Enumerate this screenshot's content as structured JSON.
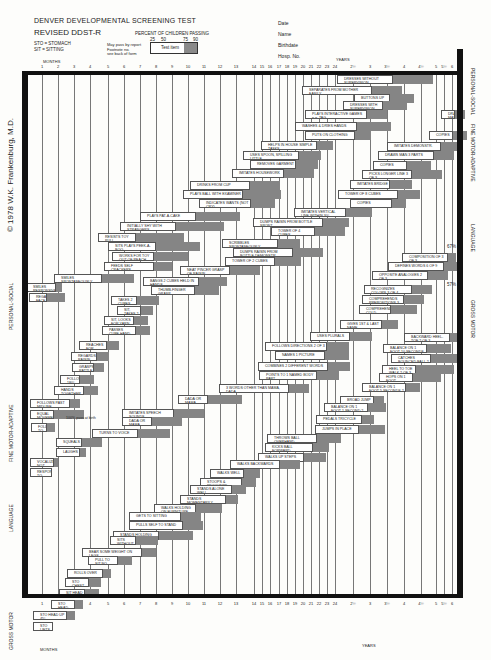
{
  "header": {
    "title": "DENVER DEVELOPMENTAL SCREENING TEST",
    "subtitle": "REVISED DDST-R",
    "abbrev_1": "STO = STOMACH",
    "abbrev_2": "SIT = SITTING",
    "percent_title": "PERCENT OF CHILDREN PASSING",
    "percent_ticks": [
      "25",
      "50",
      "75",
      "90"
    ],
    "legend_note_1": "May pass by report",
    "legend_note_2": "Footnote no.",
    "legend_note_3": "see back of form",
    "legend_item": "Test item"
  },
  "patient_fields": [
    "Date",
    "Name",
    "Birthdate",
    "Hosp. No."
  ],
  "axis": {
    "months_label": "MONTHS",
    "years_label": "YEARS",
    "ticks": [
      {
        "label": "1",
        "x": 42
      },
      {
        "label": "2",
        "x": 58
      },
      {
        "label": "3",
        "x": 74
      },
      {
        "label": "4",
        "x": 90
      },
      {
        "label": "5",
        "x": 108
      },
      {
        "label": "6",
        "x": 124
      },
      {
        "label": "7",
        "x": 140
      },
      {
        "label": "8",
        "x": 156
      },
      {
        "label": "9",
        "x": 172
      },
      {
        "label": "10",
        "x": 188
      },
      {
        "label": "11",
        "x": 204
      },
      {
        "label": "12",
        "x": 220
      },
      {
        "label": "13",
        "x": 236
      },
      {
        "label": "14",
        "x": 254
      },
      {
        "label": "15",
        "x": 262
      },
      {
        "label": "16",
        "x": 270
      },
      {
        "label": "17",
        "x": 279
      },
      {
        "label": "18",
        "x": 287
      },
      {
        "label": "19",
        "x": 295
      },
      {
        "label": "20",
        "x": 303
      },
      {
        "label": "21",
        "x": 311
      },
      {
        "label": "22",
        "x": 319
      },
      {
        "label": "23",
        "x": 327
      },
      {
        "label": "24",
        "x": 335
      },
      {
        "label": "2½",
        "x": 353
      },
      {
        "label": "3",
        "x": 370
      },
      {
        "label": "3½",
        "x": 387
      },
      {
        "label": "4",
        "x": 404
      },
      {
        "label": "4½",
        "x": 421
      },
      {
        "label": "5",
        "x": 436
      },
      {
        "label": "5½",
        "x": 444
      },
      {
        "label": "6",
        "x": 452
      }
    ]
  },
  "sections_left": [
    "GROSS MOTOR",
    "LANGUAGE",
    "FINE MOTOR-ADAPTIVE",
    "PERSONAL-SOCIAL"
  ],
  "sections_right": [
    "PERSONAL-SOCIAL",
    "FINE MOTOR-ADAPTIVE",
    "LANGUAGE",
    "GROSS MOTOR"
  ],
  "copyright": "© 1978 W.K. Frankenburg, M.D.",
  "notes": {
    "pct_67_top": "67%",
    "pct_67_bottom": "57%",
    "pct_100": "100% pass at birth"
  },
  "items": [
    {
      "label": "DRESSES WITHOUT SUPERVISION",
      "x": 337,
      "y": 77,
      "w": 56,
      "s": 40
    },
    {
      "label": "SEPARATES FROM MOTHER EASILY",
      "x": 302,
      "y": 88,
      "w": 70,
      "s": 30
    },
    {
      "label": "BUTTONS UP",
      "x": 354,
      "y": 96,
      "w": 36,
      "s": 24
    },
    {
      "label": "DRESSES WITH SUPERVISION",
      "x": 343,
      "y": 103,
      "w": 40,
      "s": 24
    },
    {
      "label": "PLAYS INTERACTIVE GAMES e.g. TAG",
      "x": 305,
      "y": 112,
      "w": 62,
      "s": 20
    },
    {
      "label": "WASHES & DRIES HANDS",
      "x": 295,
      "y": 124,
      "w": 62,
      "s": 34
    },
    {
      "label": "PUTS ON CLOTHING",
      "x": 305,
      "y": 133,
      "w": 50,
      "s": 16
    },
    {
      "label": "HELPS IN HOUSE SIMPLE TASKS",
      "x": 261,
      "y": 143,
      "w": 56,
      "s": 16
    },
    {
      "label": "USES SPOON, SPILLING LITTLE",
      "x": 243,
      "y": 153,
      "w": 56,
      "s": 22
    },
    {
      "label": "REMOVES GARMENT",
      "x": 250,
      "y": 162,
      "w": 46,
      "s": 22
    },
    {
      "label": "IMITATES HOUSEWORK",
      "x": 232,
      "y": 171,
      "w": 52,
      "s": 30
    },
    {
      "label": "DRINKS FROM CUP",
      "x": 190,
      "y": 183,
      "w": 60,
      "s": 30
    },
    {
      "label": "PLAYS BALL WITH EXAMINER",
      "x": 183,
      "y": 192,
      "w": 60,
      "s": 38
    },
    {
      "label": "INDICATES WANTS (NOT CRY)",
      "x": 199,
      "y": 201,
      "w": 52,
      "s": 24
    },
    {
      "label": "PLAYS PAT-A-CAKE",
      "x": 140,
      "y": 214,
      "w": 56,
      "s": 44
    },
    {
      "label": "INITIALLY SHY WITH STRANGERS",
      "x": 120,
      "y": 224,
      "w": 56,
      "s": 48
    },
    {
      "label": "RESISTS TOY PULL",
      "x": 98,
      "y": 235,
      "w": 38,
      "s": 48
    },
    {
      "label": "SITS PLAYS PEEK-A-BOO",
      "x": 108,
      "y": 244,
      "w": 48,
      "s": 44
    },
    {
      "label": "WORKS FOR TOY OUT OF REACH",
      "x": 112,
      "y": 254,
      "w": 42,
      "s": 34
    },
    {
      "label": "FEEDS SELF CRACKERS",
      "x": 104,
      "y": 264,
      "w": 50,
      "s": 18
    },
    {
      "label": "SMILES SPONTANEOUSLY",
      "x": 54,
      "y": 276,
      "w": 48,
      "s": 32
    },
    {
      "label": "SMILES RESPONSIVELY",
      "x": 26,
      "y": 285,
      "w": 30,
      "s": 6
    },
    {
      "label": "REGARDS FACE",
      "x": 29,
      "y": 295,
      "w": 18,
      "s": 18
    },
    {
      "label": "DRAWS MAN 6 PARTS",
      "x": 441,
      "y": 112,
      "w": 14,
      "s": 10
    },
    {
      "label": "COPIES",
      "x": 429,
      "y": 133,
      "w": 24,
      "s": 14
    },
    {
      "label": "IMITATES DEMONSTR.",
      "x": 387,
      "y": 144,
      "w": 54,
      "s": 20
    },
    {
      "label": "DRAWS MAN 3 PARTS",
      "x": 378,
      "y": 153,
      "w": 56,
      "s": 20
    },
    {
      "label": "COPIES",
      "x": 373,
      "y": 163,
      "w": 34,
      "s": 24
    },
    {
      "label": "PICKS LONGER LINE 3 OF 3",
      "x": 362,
      "y": 172,
      "w": 50,
      "s": 30
    },
    {
      "label": "IMITATES BRIDGE",
      "x": 350,
      "y": 182,
      "w": 40,
      "s": 22
    },
    {
      "label": "TOWER OF 8 CUBES",
      "x": 338,
      "y": 192,
      "w": 60,
      "s": 22
    },
    {
      "label": "COPIES",
      "x": 350,
      "y": 201,
      "w": 42,
      "s": 14
    },
    {
      "label": "IMITATES VERTICAL LINE WITHIN 30°",
      "x": 294,
      "y": 210,
      "w": 52,
      "s": 26
    },
    {
      "label": "DUMPS RAISIN FROM BOTTLE SPONT.",
      "x": 253,
      "y": 220,
      "w": 70,
      "s": 26
    },
    {
      "label": "TOWER OF 4 CUBES",
      "x": 271,
      "y": 229,
      "w": 44,
      "s": 30
    },
    {
      "label": "SCRIBBLES SPONTANEOUSLY",
      "x": 222,
      "y": 241,
      "w": 56,
      "s": 22
    },
    {
      "label": "DUMPS RAISIN FROM BOTTLE DEMONSTR.",
      "x": 233,
      "y": 250,
      "w": 60,
      "s": 30
    },
    {
      "label": "TOWER OF 2 CUBES",
      "x": 225,
      "y": 259,
      "w": 50,
      "s": 26
    },
    {
      "label": "NEAT PINCER GRASP OF RAISIN",
      "x": 180,
      "y": 268,
      "w": 50,
      "s": 30
    },
    {
      "label": "BANGS 2 CUBES HELD IN HANDS",
      "x": 143,
      "y": 279,
      "w": 56,
      "s": 28
    },
    {
      "label": "THUMB-FINGER GRASP",
      "x": 151,
      "y": 288,
      "w": 44,
      "s": 24
    },
    {
      "label": "TAKES 2 CUBES",
      "x": 111,
      "y": 298,
      "w": 26,
      "s": 22
    },
    {
      "label": "SIT, TAKES 2 CUBES",
      "x": 117,
      "y": 308,
      "w": 24,
      "s": 12
    },
    {
      "label": "SIT, LOOKS FOR YARN",
      "x": 104,
      "y": 318,
      "w": 30,
      "s": 14
    },
    {
      "label": "PASSES CUBE HAND TO HAND",
      "x": 102,
      "y": 328,
      "w": 34,
      "s": 14
    },
    {
      "label": "REACHES FOR OBJECT",
      "x": 79,
      "y": 343,
      "w": 28,
      "s": 12
    },
    {
      "label": "REGARDS RAISIN",
      "x": 71,
      "y": 354,
      "w": 26,
      "s": 12
    },
    {
      "label": "GRASPS RATTLE",
      "x": 72,
      "y": 365,
      "w": 22,
      "s": 10
    },
    {
      "label": "FOLLOWS 180°",
      "x": 60,
      "y": 377,
      "w": 20,
      "s": 14
    },
    {
      "label": "HANDS TOGETHER",
      "x": 54,
      "y": 388,
      "w": 30,
      "s": 14
    },
    {
      "label": "FOLLOWS PAST MIDLINE",
      "x": 30,
      "y": 401,
      "w": 40,
      "s": 10
    },
    {
      "label": "EQUAL MOVEMENTS",
      "x": 30,
      "y": 412,
      "w": 24,
      "s": 30
    },
    {
      "label": "FOLLOWS TO MIDLINE",
      "x": 31,
      "y": 425,
      "w": 16,
      "s": 8
    },
    {
      "label": "COMPOSITION OF 3 OF 3",
      "x": 402,
      "y": 255,
      "w": 46,
      "s": 8
    },
    {
      "label": "DEFINES WORDS 6 OF 9",
      "x": 388,
      "y": 264,
      "w": 56,
      "s": 18
    },
    {
      "label": "OPPOSITE ANALOGIES 2 OF 3",
      "x": 372,
      "y": 273,
      "w": 56,
      "s": 20
    },
    {
      "label": "RECOGNIZES COLORS 3 OF 4",
      "x": 364,
      "y": 287,
      "w": 48,
      "s": 20
    },
    {
      "label": "COMPREHENDS PREPOSITIONS 3 OF 4",
      "x": 362,
      "y": 297,
      "w": 42,
      "s": 20
    },
    {
      "label": "COMPREHENDS COLD, TIRED, HUNGRY 3 OF 3",
      "x": 359,
      "y": 307,
      "w": 32,
      "s": 26
    },
    {
      "label": "GIVES 1ST & LAST NAME",
      "x": 340,
      "y": 322,
      "w": 42,
      "s": 16
    },
    {
      "label": "USES PLURALS",
      "x": 310,
      "y": 334,
      "w": 40,
      "s": 22
    },
    {
      "label": "FOLLOWS DIRECTIONS 2 OF 3",
      "x": 265,
      "y": 344,
      "w": 62,
      "s": 22
    },
    {
      "label": "NAMES 1 PICTURE",
      "x": 275,
      "y": 353,
      "w": 50,
      "s": 24
    },
    {
      "label": "COMBINES 2 DIFFERENT WORDS",
      "x": 258,
      "y": 364,
      "w": 70,
      "s": 22
    },
    {
      "label": "POINTS TO 1 NAMED BODY PART",
      "x": 259,
      "y": 373,
      "w": 58,
      "s": 22
    },
    {
      "label": "3 WORDS OTHER THAN MAMA, DADA",
      "x": 219,
      "y": 386,
      "w": 70,
      "s": 20
    },
    {
      "label": "DADA OR MAMA SPECIFIC",
      "x": 178,
      "y": 397,
      "w": 30,
      "s": 34
    },
    {
      "label": "IMITATES SPEECH SOUNDS",
      "x": 122,
      "y": 411,
      "w": 52,
      "s": 30
    },
    {
      "label": "DADA OR MAMA NONSPECIFIC",
      "x": 122,
      "y": 419,
      "w": 30,
      "s": 30
    },
    {
      "label": "TURNS TO VOICE",
      "x": 92,
      "y": 431,
      "w": 46,
      "s": 32
    },
    {
      "label": "SQUEALS",
      "x": 56,
      "y": 440,
      "w": 26,
      "s": 20
    },
    {
      "label": "LAUGHS",
      "x": 56,
      "y": 450,
      "w": 24,
      "s": 6
    },
    {
      "label": "VOCALIZES NOT CRYING",
      "x": 30,
      "y": 460,
      "w": 24,
      "s": 4
    },
    {
      "label": "RESPONDS TO BELL",
      "x": 30,
      "y": 470,
      "w": 22,
      "s": 0
    },
    {
      "label": "BACKWARD HEEL-TOE 2 OF 3",
      "x": 404,
      "y": 335,
      "w": 46,
      "s": 8
    },
    {
      "label": "BALANCE ON 1 FOOT 10 SECONDS 2 OF 3",
      "x": 383,
      "y": 346,
      "w": 44,
      "s": 24
    },
    {
      "label": "CATCHES BOUNCED BALL 2 OF 3",
      "x": 391,
      "y": 356,
      "w": 40,
      "s": 26
    },
    {
      "label": "HEEL TO TOE WALK 2 OF 3",
      "x": 382,
      "y": 367,
      "w": 34,
      "s": 38
    },
    {
      "label": "HOPS ON 1 FOOT",
      "x": 379,
      "y": 375,
      "w": 34,
      "s": 28
    },
    {
      "label": "BALANCE ON 1 FOOT 5 SECONDS 2 OF 3",
      "x": 362,
      "y": 385,
      "w": 44,
      "s": 14
    },
    {
      "label": "BROAD JUMP",
      "x": 340,
      "y": 398,
      "w": 34,
      "s": 10
    },
    {
      "label": "BALANCE ON 1 FOOT 1 SECOND 2 OF 3",
      "x": 324,
      "y": 405,
      "w": 44,
      "s": 18
    },
    {
      "label": "PEDALS TRICYCLE",
      "x": 316,
      "y": 417,
      "w": 46,
      "s": 12
    },
    {
      "label": "JUMPS IN PLACE",
      "x": 315,
      "y": 427,
      "w": 44,
      "s": 26
    },
    {
      "label": "THROWS BALL OVERHAND",
      "x": 267,
      "y": 436,
      "w": 50,
      "s": 24
    },
    {
      "label": "KICKS BALL FORWARD",
      "x": 265,
      "y": 445,
      "w": 48,
      "s": 16
    },
    {
      "label": "WALKS UP STEPS",
      "x": 258,
      "y": 455,
      "w": 46,
      "s": 22
    },
    {
      "label": "WALKS BACKWARDS",
      "x": 230,
      "y": 462,
      "w": 50,
      "s": 20
    },
    {
      "label": "WALKS WELL",
      "x": 210,
      "y": 471,
      "w": 34,
      "s": 16
    },
    {
      "label": "STOOPS & RECOVERS",
      "x": 200,
      "y": 480,
      "w": 42,
      "s": 14
    },
    {
      "label": "STANDS ALONE WELL",
      "x": 190,
      "y": 487,
      "w": 42,
      "s": 14
    },
    {
      "label": "STANDS MOMENTARILY",
      "x": 180,
      "y": 497,
      "w": 46,
      "s": 12
    },
    {
      "label": "WALKS HOLDING ON FURNITURE",
      "x": 154,
      "y": 506,
      "w": 42,
      "s": 26
    },
    {
      "label": "GETS TO SITTING",
      "x": 129,
      "y": 514,
      "w": 52,
      "s": 20
    },
    {
      "label": "PULLS SELF TO STAND",
      "x": 129,
      "y": 523,
      "w": 54,
      "s": 20
    },
    {
      "label": "STANDS HOLDING ON",
      "x": 113,
      "y": 533,
      "w": 46,
      "s": 34
    },
    {
      "label": "SITS WITHOUT SUPPORT",
      "x": 110,
      "y": 538,
      "w": 26,
      "s": 22
    },
    {
      "label": "BEAR SOME WEIGHT ON LEGS",
      "x": 82,
      "y": 550,
      "w": 60,
      "s": 14
    },
    {
      "label": "PULL TO SIT NO HEAD LAG",
      "x": 88,
      "y": 558,
      "w": 30,
      "s": 14
    },
    {
      "label": "ROLLS OVER",
      "x": 67,
      "y": 571,
      "w": 36,
      "s": 8
    },
    {
      "label": "STO CHEST UP ARM SUPPORT",
      "x": 65,
      "y": 580,
      "w": 24,
      "s": 12
    },
    {
      "label": "SIT HEAD STEADY",
      "x": 59,
      "y": 591,
      "w": 26,
      "s": 14
    },
    {
      "label": "STO HEAD UP 90°",
      "x": 51,
      "y": 602,
      "w": 24,
      "s": 8
    },
    {
      "label": "STO HEAD UP 45°",
      "x": 33,
      "y": 613,
      "w": 34,
      "s": 8
    },
    {
      "label": "STO LIFTS HEAD",
      "x": 33,
      "y": 624,
      "w": 20,
      "s": 0
    }
  ]
}
